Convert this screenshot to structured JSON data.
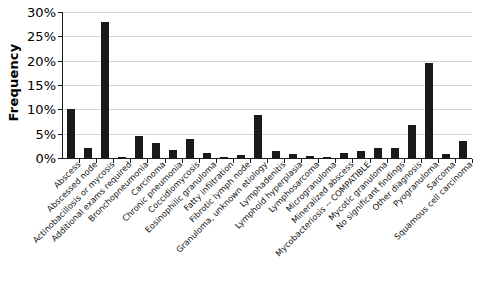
{
  "chart_data": {
    "type": "bar",
    "title": "",
    "xlabel": "",
    "ylabel": "Frequency",
    "ylim": [
      0,
      30
    ],
    "y_tick_labels": [
      "30%",
      "25%",
      "20%",
      "15%",
      "10%",
      "5%",
      "0%"
    ],
    "y_tick_values": [
      30,
      25,
      20,
      15,
      10,
      5,
      0
    ],
    "grid": true,
    "legend": "none",
    "units": "percent",
    "categories": [
      "Abscess",
      "Abscessed node",
      "Actinobacillosis or mycosis",
      "Additional exams required",
      "Bronchopneumonia",
      "Carcinoma",
      "Chronic pneumonia",
      "Coccidiomycosis",
      "Eosinophilic granuloma",
      "Fatty infiltration",
      "Fibrotic lymph node",
      "Granuloma, unknown etiology",
      "Lymphadenitis",
      "Lymphoid hyperplasia",
      "Lymphosarcoma",
      "Microgranuloma",
      "Mineralized abscess",
      "Mycobacteriosis -- COMPATIBLE",
      "Mycotic granuloma",
      "No significant findings",
      "Other diagnosis",
      "Pyogranuloma",
      "Sarcoma",
      "Squamous cell carcinoma"
    ],
    "values": [
      10.1,
      2.1,
      27.9,
      0.15,
      4.5,
      3.1,
      1.6,
      4.0,
      1.0,
      0.2,
      0.6,
      8.8,
      1.5,
      0.9,
      0.4,
      0.1,
      1.0,
      1.4,
      2.1,
      2.0,
      6.7,
      19.6,
      0.8,
      3.5
    ]
  }
}
